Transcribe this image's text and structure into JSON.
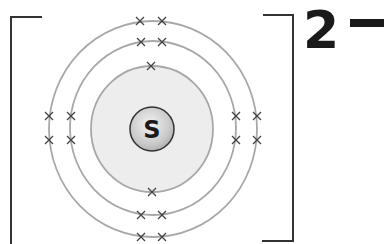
{
  "nucleus": {
    "symbol": "S"
  },
  "charge": {
    "number": "2",
    "sign": "−"
  },
  "shells": [
    {
      "name": "shell-1",
      "electrons": 2
    },
    {
      "name": "shell-2",
      "electrons": 8
    },
    {
      "name": "shell-3",
      "electrons": 8
    }
  ],
  "colors": {
    "ring": "#a8a8a8",
    "shading": "#ececec",
    "nucleus_fill": "#cfcfcf",
    "ink": "#1a1a1a",
    "cross": "#555555"
  }
}
